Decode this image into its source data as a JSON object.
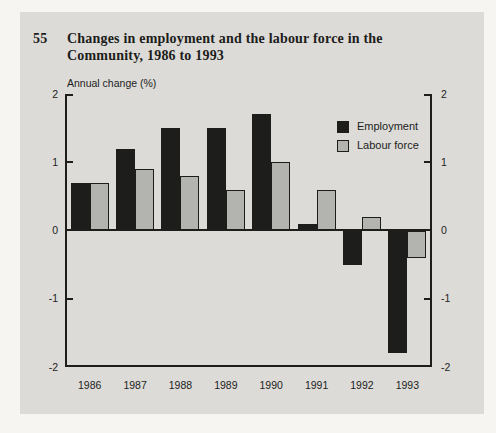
{
  "header": {
    "figure_number": "55",
    "title_line1": "Changes in employment and the labour force in the",
    "title_line2": "Community, 1986 to 1993"
  },
  "chart": {
    "axis_title": "Annual change (%)"
  },
  "legend": [
    {
      "label": "Employment"
    },
    {
      "label": "Labour force"
    }
  ],
  "colors": {
    "page_background": "#f6f5f2",
    "panel_background": "#dcdbd8",
    "employment_bar": "#1d1d1b",
    "labour_force_bar": "#b3b3b0",
    "axis": "#1d1d1b",
    "text": "#1d1d1b"
  },
  "chart_data": {
    "type": "bar",
    "title": "Changes in employment and the labour force in the Community, 1986 to 1993",
    "ylabel": "Annual change (%)",
    "xlabel": "",
    "categories": [
      "1986",
      "1987",
      "1988",
      "1989",
      "1990",
      "1991",
      "1992",
      "1993"
    ],
    "series": [
      {
        "name": "Employment",
        "values": [
          0.7,
          1.2,
          1.5,
          1.5,
          1.7,
          0.1,
          -0.5,
          -1.8
        ]
      },
      {
        "name": "Labour force",
        "values": [
          0.7,
          0.9,
          0.8,
          0.6,
          1.0,
          0.6,
          0.2,
          -0.4
        ]
      }
    ],
    "ylim": [
      -2,
      2
    ],
    "yticks": [
      2,
      1,
      0,
      -1,
      -2
    ],
    "grid": false,
    "legend_position": "upper-right-inside"
  }
}
